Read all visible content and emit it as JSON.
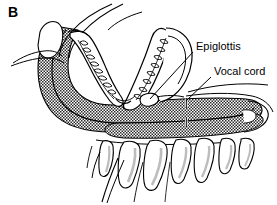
{
  "figure": {
    "panel_label": "B",
    "type": "anatomical-line-drawing",
    "background_color": "#ffffff",
    "ink_color": "#000000",
    "shading_color": "#3a3a3a",
    "bone_shadow_color": "#b9b9b9",
    "width": 277,
    "height": 205
  },
  "annotations": [
    {
      "id": "epiglottis",
      "label": "Epiglottis",
      "text_x": 196,
      "text_y": 41,
      "leader_from_x": 193,
      "leader_from_y": 52,
      "leader_to_x": 150,
      "leader_to_y": 99
    },
    {
      "id": "vocal-cord",
      "label": "Vocal cord",
      "text_x": 214,
      "text_y": 66,
      "leader_from_x": 211,
      "leader_from_y": 77,
      "leader_to_x": 186,
      "leader_to_y": 101
    }
  ],
  "structures": [
    {
      "id": "airway-band",
      "name": "pharyngeal airway shaded band",
      "fill": "hatched-dark"
    },
    {
      "id": "dental-arch",
      "name": "V-shaped dental arch with teeth",
      "fill": "white"
    },
    {
      "id": "nasal-passage",
      "name": "nasal passage curves",
      "fill": "none"
    },
    {
      "id": "lip-nose",
      "name": "upper lip and nose profile",
      "fill": "white"
    },
    {
      "id": "epiglottis-flap",
      "name": "epiglottis flap",
      "fill": "white"
    },
    {
      "id": "vocal-cord-gap",
      "name": "vocal cord white gap in airway band",
      "fill": "white"
    },
    {
      "id": "cervical-vertebrae",
      "name": "cervical vertebral bodies",
      "count": 7,
      "fill": "white"
    }
  ]
}
